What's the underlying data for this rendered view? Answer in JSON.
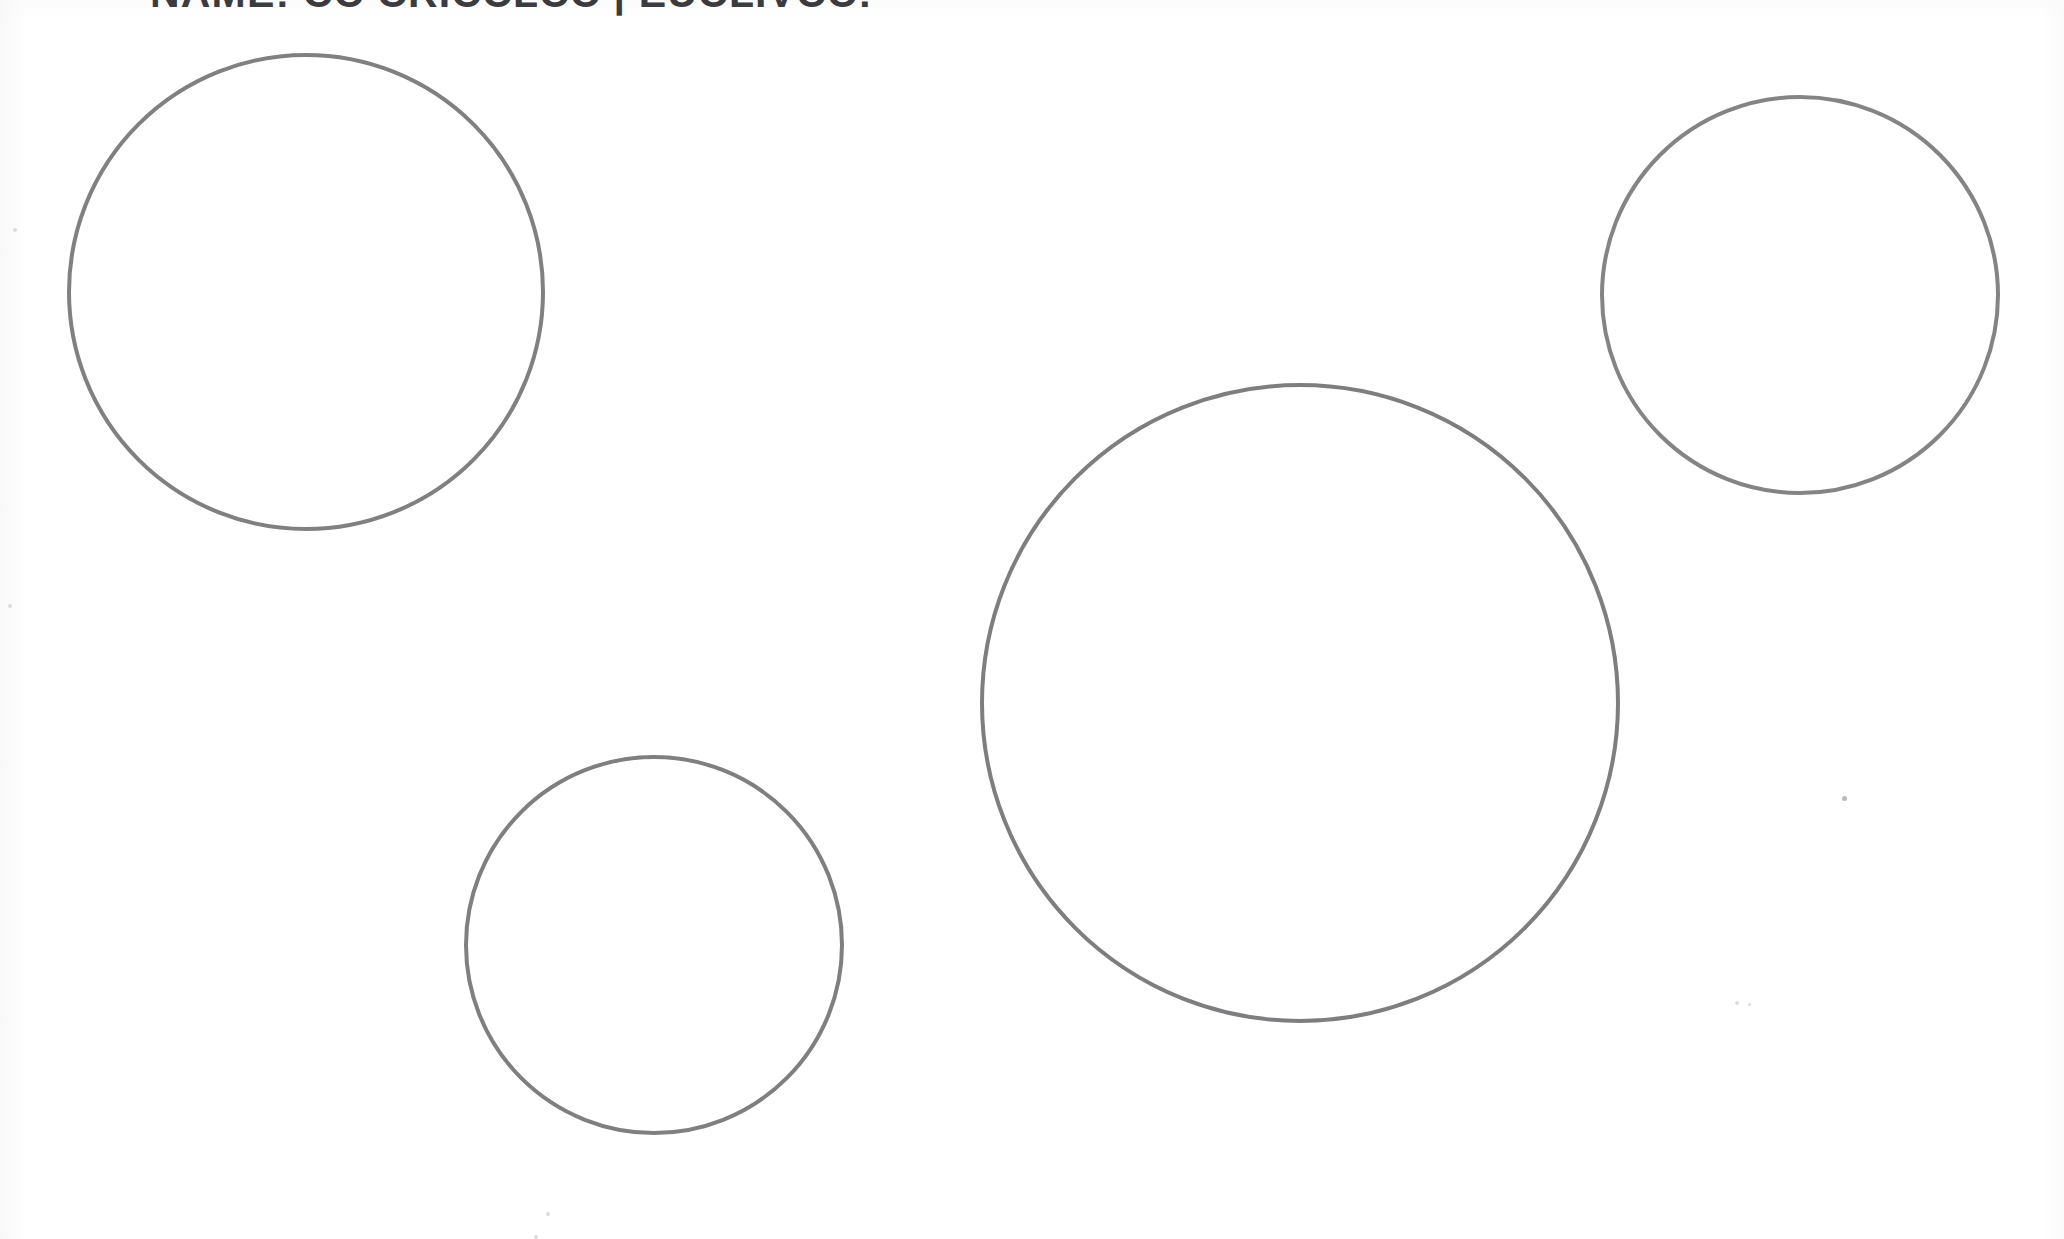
{
  "page": {
    "width": 2064,
    "height": 1239,
    "background_color": "#ffffff",
    "document_type": "scanned worksheet",
    "header_text": "NAME: CC CRICCLCC | EUCLIVCC:",
    "header_note": "clipped at top edge of scan"
  },
  "style": {
    "stroke_color": "#808082",
    "stroke_width_px": 4,
    "fill": "none"
  },
  "shapes": [
    {
      "name": "circle-large-top-left",
      "label": "Large circle (top left)",
      "cx": 306,
      "cy": 292,
      "r": 239,
      "diameter": 478,
      "stroke": "#808082",
      "stroke_width": 4
    },
    {
      "name": "circle-medium-center",
      "label": "Medium-large circle (center right)",
      "cx": 1300,
      "cy": 703,
      "r": 320,
      "diameter": 640,
      "stroke": "#7e7e80",
      "stroke_width": 4
    },
    {
      "name": "circle-small-top-right",
      "label": "Small circle (top right)",
      "cx": 1800,
      "cy": 295,
      "r": 200,
      "diameter": 400,
      "stroke": "#848486",
      "stroke_width": 4
    },
    {
      "name": "circle-small-bottom-left",
      "label": "Small circle (bottom left)",
      "cx": 654,
      "cy": 945,
      "r": 190,
      "diameter": 380,
      "stroke": "#7f7f81",
      "stroke_width": 4
    }
  ],
  "artifacts": [
    {
      "name": "scan-speck-right",
      "x": 1842,
      "y": 796,
      "size": 5,
      "faint": false
    },
    {
      "name": "scan-speck-right-lower",
      "x": 1735,
      "y": 1001,
      "size": 4,
      "faint": true
    },
    {
      "name": "scan-speck-right-lower-2",
      "x": 1748,
      "y": 1003,
      "size": 3,
      "faint": true
    },
    {
      "name": "scan-speck-bottom-left",
      "x": 546,
      "y": 1212,
      "size": 4,
      "faint": true
    },
    {
      "name": "scan-speck-bottom-left-2",
      "x": 534,
      "y": 1235,
      "size": 4,
      "faint": true
    },
    {
      "name": "scan-speck-upper-left",
      "x": 13,
      "y": 228,
      "size": 4,
      "faint": true
    },
    {
      "name": "scan-speck-mid-left",
      "x": 8,
      "y": 604,
      "size": 4,
      "faint": true
    }
  ]
}
